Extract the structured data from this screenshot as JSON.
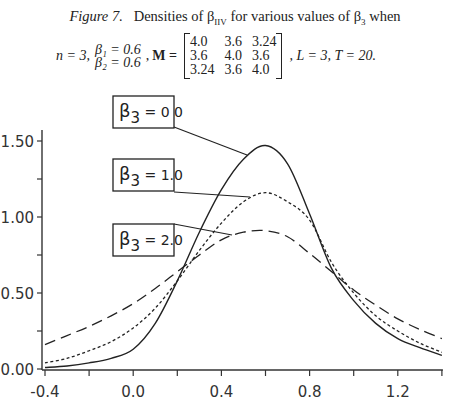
{
  "caption": {
    "figure_label": "Figure 7.",
    "text_before": "Densities of β",
    "sub1": "IIV",
    "text_mid": " for various values of β",
    "sub2": "3",
    "text_after": " when"
  },
  "conditions": {
    "n": "n = 3,",
    "beta1": "β₁ = 0.6",
    "beta2": "β₂ = 0.6",
    "comma": ",",
    "M_label": "M =",
    "matrix": [
      [
        "4.0",
        "3.6",
        "3.24"
      ],
      [
        "3.6",
        "4.0",
        "3.6"
      ],
      [
        "3.24",
        "3.6",
        "4.0"
      ]
    ],
    "tail": ", L = 3, T = 20."
  },
  "chart_data": {
    "type": "line",
    "xlabel": "",
    "ylabel": "",
    "xlim": [
      -0.4,
      1.4
    ],
    "ylim": [
      0.0,
      1.6
    ],
    "grid": false,
    "x_ticks": [
      -0.4,
      -0.2,
      0.0,
      0.2,
      0.4,
      0.6,
      0.8,
      1.0,
      1.2,
      1.4
    ],
    "x_tick_labels": [
      "-0.4",
      "0.0",
      "0.4",
      "0.8",
      "1.2"
    ],
    "x_tick_label_values": [
      -0.4,
      0.0,
      0.4,
      0.8,
      1.2
    ],
    "y_ticks": [
      0.0,
      0.25,
      0.5,
      0.75,
      1.0,
      1.25,
      1.5
    ],
    "y_tick_labels": [
      "0.00",
      "0.50",
      "1.00",
      "1.50"
    ],
    "y_tick_label_values": [
      0.0,
      0.5,
      1.0,
      1.5
    ],
    "x": [
      -0.4,
      -0.3,
      -0.2,
      -0.1,
      0.0,
      0.1,
      0.2,
      0.3,
      0.4,
      0.5,
      0.6,
      0.7,
      0.8,
      0.9,
      1.0,
      1.1,
      1.2,
      1.3,
      1.4
    ],
    "series": [
      {
        "name": "β3 = 0.0",
        "label": "= 0 0",
        "style": "solid",
        "values": [
          0.01,
          0.02,
          0.04,
          0.07,
          0.13,
          0.3,
          0.58,
          0.9,
          1.18,
          1.38,
          1.47,
          1.35,
          1.02,
          0.66,
          0.45,
          0.3,
          0.2,
          0.14,
          0.09
        ]
      },
      {
        "name": "β3 = 1.0",
        "label": "= 1.0",
        "style": "dotted",
        "values": [
          0.04,
          0.07,
          0.12,
          0.18,
          0.27,
          0.4,
          0.58,
          0.78,
          0.96,
          1.1,
          1.16,
          1.1,
          0.98,
          0.7,
          0.5,
          0.35,
          0.25,
          0.17,
          0.11
        ]
      },
      {
        "name": "β3 = 2.0",
        "label": "= 2.0",
        "style": "dashed",
        "values": [
          0.16,
          0.22,
          0.28,
          0.35,
          0.43,
          0.53,
          0.64,
          0.75,
          0.85,
          0.9,
          0.91,
          0.87,
          0.76,
          0.64,
          0.52,
          0.42,
          0.33,
          0.26,
          0.2
        ]
      }
    ],
    "legend": {
      "position": "left, boxed labels with leader lines",
      "entries": [
        {
          "symbol": "β",
          "sub": "3",
          "text": "= 0 0"
        },
        {
          "symbol": "β",
          "sub": "3",
          "text": "= 1.0"
        },
        {
          "symbol": "β",
          "sub": "3",
          "text": "= 2.0"
        }
      ]
    }
  }
}
